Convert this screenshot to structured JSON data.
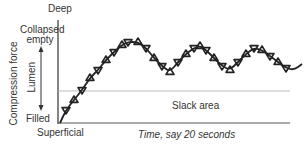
{
  "diagram": {
    "labels": {
      "top": "Deep",
      "upper": "Collapsed\nempty",
      "upper_line1": "Collapsed",
      "upper_line2": "empty",
      "lower": "Filled",
      "bottom": "Superficial",
      "y_axis": "Compression force",
      "lumen": "Lumen",
      "region": "Slack area",
      "x_axis": "Time, say 20 seconds"
    },
    "colors": {
      "line": "#222222",
      "axis": "#333333",
      "slack_line": "#aaaaaa",
      "baseline": "#555555"
    },
    "waveform": {
      "description": "Wavy compression trace with triangular loop markers rising from Filled then oscillating above slack area",
      "points": [
        [
          60,
          123
        ],
        [
          66,
          110
        ],
        [
          74,
          100
        ],
        [
          82,
          90
        ],
        [
          90,
          78
        ],
        [
          98,
          70
        ],
        [
          106,
          60
        ],
        [
          114,
          52
        ],
        [
          122,
          45
        ],
        [
          128,
          42
        ],
        [
          138,
          42
        ],
        [
          146,
          48
        ],
        [
          154,
          58
        ],
        [
          162,
          66
        ],
        [
          170,
          72
        ],
        [
          178,
          62
        ],
        [
          186,
          54
        ],
        [
          194,
          48
        ],
        [
          200,
          46
        ],
        [
          206,
          50
        ],
        [
          214,
          58
        ],
        [
          222,
          66
        ],
        [
          230,
          70
        ],
        [
          238,
          62
        ],
        [
          246,
          54
        ],
        [
          254,
          48
        ],
        [
          262,
          50
        ],
        [
          270,
          56
        ],
        [
          278,
          62
        ],
        [
          286,
          68
        ],
        [
          294,
          70
        ],
        [
          302,
          64
        ]
      ]
    }
  }
}
